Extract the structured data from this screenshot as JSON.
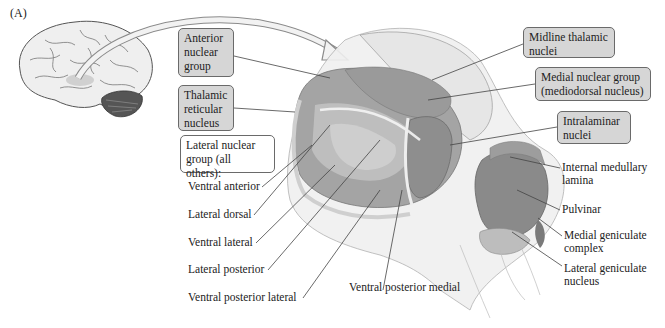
{
  "figure": {
    "panel_label": "(A)"
  },
  "boxed_labels": [
    {
      "id": "anterior",
      "text_lines": [
        "Anterior",
        "nuclear",
        "group"
      ],
      "style": "shaded"
    },
    {
      "id": "reticular",
      "text_lines": [
        "Thalamic",
        "reticular",
        "nucleus"
      ],
      "style": "shaded"
    },
    {
      "id": "lateral_group",
      "text_lines": [
        "Lateral nuclear",
        "group (all others):"
      ],
      "style": "plain"
    },
    {
      "id": "midline",
      "text_lines": [
        "Midline thalamic",
        "nuclei"
      ],
      "style": "shaded"
    },
    {
      "id": "medial",
      "text_lines": [
        "Medial nuclear group",
        "(mediodorsal nucleus)"
      ],
      "style": "shaded"
    },
    {
      "id": "intralaminar",
      "text_lines": [
        "Intralaminar",
        "nuclei"
      ],
      "style": "shaded"
    }
  ],
  "lateral_group_labels": [
    "Ventral anterior",
    "Lateral dorsal",
    "Ventral lateral",
    "Lateral posterior",
    "Ventral posterior lateral"
  ],
  "other_labels": {
    "ventral_posterior_medial": "Ventral posterior medial",
    "internal_medullary": [
      "Internal medullary",
      "lamina"
    ],
    "pulvinar": "Pulvinar",
    "medial_geniculate": [
      "Medial geniculate",
      "complex"
    ],
    "lateral_geniculate": [
      "Lateral geniculate",
      "nucleus"
    ]
  },
  "colors": {
    "box_fill": "#d6d6d6",
    "thalamus_dark": "#8f8f8f",
    "thalamus_mid": "#b3b3b3",
    "thalamus_light": "#d9d9d9",
    "leader_line": "#444444"
  }
}
